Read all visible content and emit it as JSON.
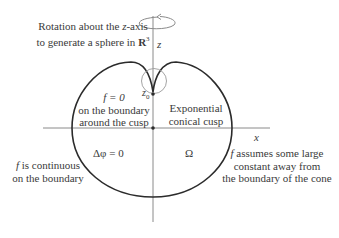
{
  "diagram": {
    "rotation_caption": {
      "line1_pre": "Rotation about the ",
      "line1_var": "z",
      "line1_post": "-axis",
      "line2_pre": "to generate a sphere in ",
      "line2_set": "R",
      "line2_exp": "3"
    },
    "axes": {
      "z_label": "z",
      "x_label": "x"
    },
    "cusp_point_label": "z",
    "cusp_point_sub": "0",
    "labels": {
      "f_zero_eq": "f = 0",
      "f_zero_line2": "on the boundary",
      "f_zero_line3": "around the cusp",
      "cusp_line1": "Exponential",
      "cusp_line2": "conical cusp",
      "laplace": "Δφ = 0",
      "domain": "Ω",
      "continuous_var": "f",
      "continuous_line1": " is continuous",
      "continuous_line2": "on the boundary",
      "assumes_var": "f",
      "assumes_line1": " assumes some large",
      "assumes_line2": "constant away from",
      "assumes_line3": "the boundary of the cone"
    },
    "colors": {
      "curve": "#2b2b2b",
      "axis": "#8a8a8a",
      "text": "#3a3a3a",
      "circle": "#9a9a9a"
    }
  }
}
